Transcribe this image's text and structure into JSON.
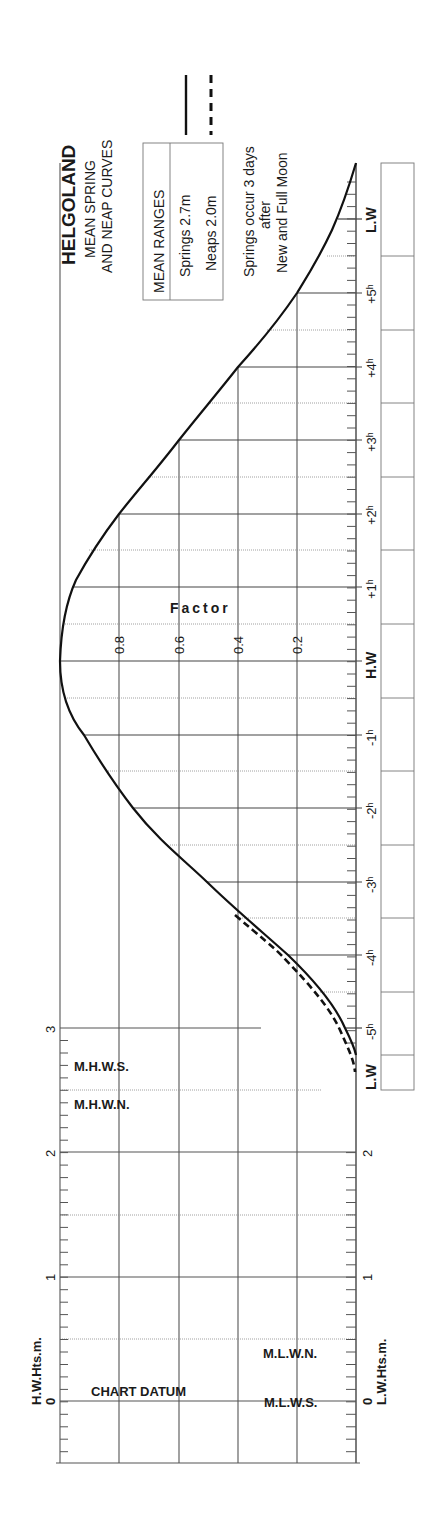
{
  "title": {
    "station": "HELGOLAND",
    "line1": "MEAN SPRING",
    "line2": "AND NEAP CURVES"
  },
  "legend": {
    "header": "MEAN RANGES",
    "springs": "Springs 2.7m",
    "neaps": "Neaps 2.0m",
    "springs_style": "solid",
    "neaps_style": "dashed"
  },
  "note": {
    "line1": "Springs occur 3 days",
    "line2": "after",
    "line3": "New and Full Moon"
  },
  "factor_axis": {
    "label": "Factor",
    "ticks": [
      "0.8",
      "0.6",
      "0.4",
      "0.2"
    ]
  },
  "time_axis": {
    "labels": [
      "L.W",
      "+5ʰ",
      "+4ʰ",
      "+3ʰ",
      "+2ʰ",
      "+1ʰ",
      "H.W",
      "-1ʰ",
      "-2ʰ",
      "-3ʰ",
      "-4ʰ",
      "-5ʰ",
      "L.W"
    ]
  },
  "height_axis": {
    "hw_label": "H.W.Hts.m.",
    "lw_label": "L.W.Hts.m.",
    "hw_ticks": [
      "0",
      "1",
      "2",
      "3"
    ],
    "lw_ticks": [
      "0",
      "1",
      "2"
    ],
    "levels": {
      "mhws": "M.H.W.S.",
      "mhwn": "M.H.W.N.",
      "mlwn": "M.L.W.N.",
      "mlws": "M.L.W.S.",
      "chart_datum": "CHART DATUM"
    }
  },
  "chart_data": {
    "type": "line",
    "xlabel": "Hours relative to H.W",
    "ylabel": "Factor",
    "ylim": [
      0,
      1
    ],
    "x": [
      -5.85,
      -5.5,
      -5,
      -4.5,
      -4,
      -3.5,
      -3,
      -2.5,
      -2,
      -1.5,
      -1,
      -0.5,
      0,
      0.5,
      1,
      1.5,
      2,
      2.5,
      3,
      3.5,
      4,
      4.5,
      5,
      5.5,
      6.05
    ],
    "series": [
      {
        "name": "Springs 2.7m",
        "style": "solid",
        "values": [
          0.0,
          0.0,
          0.04,
          0.12,
          0.23,
          0.4,
          0.5,
          0.63,
          0.75,
          0.84,
          0.92,
          0.98,
          1.0,
          0.99,
          0.96,
          0.9,
          0.8,
          0.7,
          0.6,
          0.5,
          0.4,
          0.3,
          0.2,
          0.1,
          0.0
        ]
      },
      {
        "name": "Neaps 2.0m",
        "style": "dashed",
        "note": "Diverges from springs only between -3.5h and L.W",
        "x": [
          -5.6,
          -5.5,
          -5,
          -4.5,
          -4,
          -3.5
        ],
        "values": [
          0.0,
          0.01,
          0.06,
          0.15,
          0.26,
          0.41
        ]
      }
    ],
    "height_scale": {
      "hw_range_m": [
        -0.5,
        3.0
      ],
      "lw_range_m": [
        -0.5,
        2.0
      ],
      "MHWS_m": 2.7,
      "MHWN_m": 2.5,
      "MLWN_m": 0.5,
      "MLWS_m": 0.0
    },
    "grid": true
  }
}
